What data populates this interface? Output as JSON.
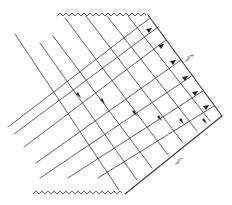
{
  "diagram": {
    "type": "conformal-spacetime-diagram",
    "labels": {
      "scri_plus": "𝒥",
      "scri_plus_sup": "+",
      "scri_minus": "𝒥",
      "scri_minus_sup": "−"
    },
    "colors": {
      "line": "#3a3a3a",
      "thin_line": "#6a6a6a",
      "background": "#ffffff"
    },
    "elements": {
      "top_singularity": "wavy line (top)",
      "bottom_singularity": "wavy line (bottom)",
      "future_null_infinity": "right upper edge labeled J+",
      "past_null_infinity": "right lower edge labeled J-",
      "arrow_count_on_grid": 11
    }
  }
}
